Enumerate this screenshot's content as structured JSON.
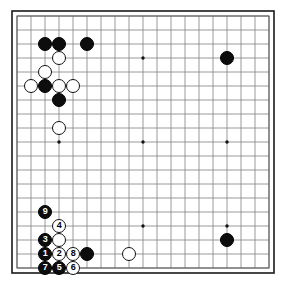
{
  "app": {
    "title": "Go Board Diagram",
    "background_color": "#ffffff"
  },
  "board": {
    "name": "go-board",
    "size": 19,
    "line_color": "#808080",
    "border_color": "#1a1a1a",
    "background_color": "#ffffff",
    "origin_x": 17,
    "origin_y": 16,
    "spacing": 14,
    "star_points": [
      {
        "col": 4,
        "row": 4
      },
      {
        "col": 10,
        "row": 4
      },
      {
        "col": 16,
        "row": 4
      },
      {
        "col": 4,
        "row": 10
      },
      {
        "col": 10,
        "row": 10
      },
      {
        "col": 16,
        "row": 10
      },
      {
        "col": 4,
        "row": 16
      },
      {
        "col": 10,
        "row": 16
      },
      {
        "col": 16,
        "row": 16
      }
    ]
  },
  "stones": [
    {
      "id": "b-c3-r3",
      "color": "black",
      "col": 3,
      "row": 3,
      "label": ""
    },
    {
      "id": "b-c4-r3",
      "color": "black",
      "col": 4,
      "row": 3,
      "label": ""
    },
    {
      "id": "b-c6-r3",
      "color": "black",
      "col": 6,
      "row": 3,
      "label": ""
    },
    {
      "id": "b-c16-r4",
      "color": "black",
      "col": 16,
      "row": 4,
      "label": ""
    },
    {
      "id": "w-c4-r4",
      "color": "white",
      "col": 4,
      "row": 4,
      "label": ""
    },
    {
      "id": "w-c3-r5",
      "color": "white",
      "col": 3,
      "row": 5,
      "label": ""
    },
    {
      "id": "w-c2-r6",
      "color": "white",
      "col": 2,
      "row": 6,
      "label": ""
    },
    {
      "id": "b-c3-r6",
      "color": "black",
      "col": 3,
      "row": 6,
      "label": ""
    },
    {
      "id": "w-c4-r6",
      "color": "white",
      "col": 4,
      "row": 6,
      "label": ""
    },
    {
      "id": "w-c5-r6",
      "color": "white",
      "col": 5,
      "row": 6,
      "label": ""
    },
    {
      "id": "b-c4-r7",
      "color": "black",
      "col": 4,
      "row": 7,
      "label": ""
    },
    {
      "id": "w-c4-r9",
      "color": "white",
      "col": 4,
      "row": 9,
      "label": ""
    },
    {
      "id": "b-c3-r15",
      "color": "black",
      "col": 3,
      "row": 15,
      "label": "9"
    },
    {
      "id": "w-c4-r16",
      "color": "white",
      "col": 4,
      "row": 16,
      "label": "4"
    },
    {
      "id": "b-c3-r17",
      "color": "black",
      "col": 3,
      "row": 17,
      "label": "3"
    },
    {
      "id": "w-c4-r17",
      "color": "white",
      "col": 4,
      "row": 17,
      "label": ""
    },
    {
      "id": "b-c3-r18",
      "color": "black",
      "col": 3,
      "row": 18,
      "label": "1"
    },
    {
      "id": "w-c4-r18",
      "color": "white",
      "col": 4,
      "row": 18,
      "label": "2"
    },
    {
      "id": "w-c5-r18",
      "color": "white",
      "col": 5,
      "row": 18,
      "label": "8"
    },
    {
      "id": "b-c6-r18",
      "color": "black",
      "col": 6,
      "row": 18,
      "label": ""
    },
    {
      "id": "w-c9-r18",
      "color": "white",
      "col": 9,
      "row": 18,
      "label": ""
    },
    {
      "id": "b-c16-r17",
      "color": "black",
      "col": 16,
      "row": 17,
      "label": ""
    },
    {
      "id": "b-c3-r19",
      "color": "black",
      "col": 3,
      "row": 19,
      "label": "7"
    },
    {
      "id": "b-c4-r19",
      "color": "black",
      "col": 4,
      "row": 19,
      "label": "5"
    },
    {
      "id": "w-c5-r19",
      "color": "white",
      "col": 5,
      "row": 19,
      "label": "6"
    }
  ],
  "move_sequence": [
    "1",
    "2",
    "3",
    "4",
    "5",
    "6",
    "7",
    "8",
    "9"
  ]
}
